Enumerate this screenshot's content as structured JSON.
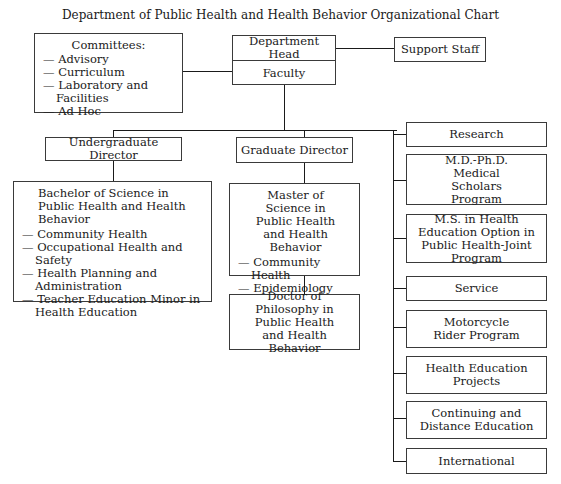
{
  "title": "Department of Public Health and Health Behavior Organizational Chart",
  "committees": {
    "heading": "Committees:",
    "items": [
      "— Advisory",
      "— Curriculum",
      "— Laboratory and Facilities",
      "— Ad Hoc"
    ]
  },
  "head": {
    "label": "Department Head",
    "faculty": "Faculty"
  },
  "support_staff": "Support Staff",
  "undergrad": {
    "director": "Undergraduate Director",
    "degree_title": "Bachelor of Science in Public Health and Health Behavior",
    "items": [
      "— Community Health",
      "— Occupational Health and Safety",
      "— Health Planning and Administration",
      "— Teacher Education Minor in Health Education"
    ]
  },
  "graduate": {
    "director": "Graduate Director",
    "ms_title": "Master of Science in Public Health and Health Behavior",
    "ms_items": [
      "— Community Health",
      "— Epidemiology",
      "— Health Behavior"
    ],
    "phd_title": "Doctor of Philosophy in Public Health and Health Behavior"
  },
  "right_column": [
    "Research",
    "M.D.-Ph.D. Medical Scholars Program",
    "M.S. in Health Education Option in Public Health-Joint Program",
    "Service",
    "Motorcycle Rider Program",
    "Health Education Projects",
    "Continuing and Distance Education",
    "International"
  ]
}
